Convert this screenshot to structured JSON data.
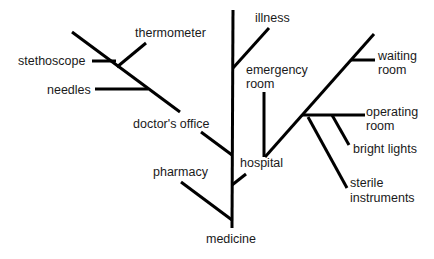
{
  "diagram": {
    "type": "tree",
    "root": "medicine",
    "line_color": "#000000",
    "text_color": "#1a1a1a",
    "labels": {
      "thermometer": "thermometer",
      "stethoscope": "stethoscope",
      "needles": "needles",
      "doctors_office": "doctor's office",
      "pharmacy": "pharmacy",
      "illness": "illness",
      "emergency_room_1": "emergency",
      "emergency_room_2": "room",
      "hospital": "hospital",
      "waiting_room_1": "waiting",
      "waiting_room_2": "room",
      "operating_room_1": "operating",
      "operating_room_2": "room",
      "bright_lights": "bright lights",
      "sterile_instruments_1": "sterile",
      "sterile_instruments_2": "instruments",
      "medicine": "medicine"
    },
    "structure": {
      "medicine": [
        "pharmacy",
        "doctor's office",
        "hospital",
        "illness"
      ],
      "doctor's office": [
        "stethoscope",
        "thermometer",
        "needles"
      ],
      "hospital": [
        "emergency room",
        "waiting room",
        "operating room",
        "bright lights",
        "sterile instruments"
      ]
    }
  }
}
